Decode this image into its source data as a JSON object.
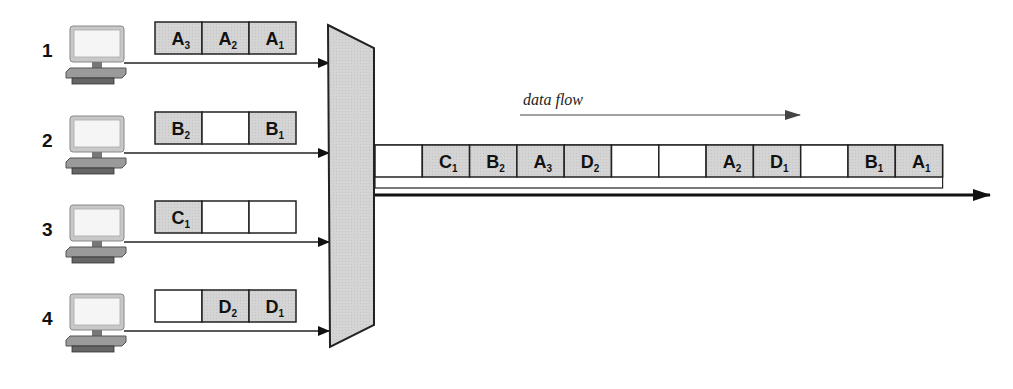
{
  "diagram": {
    "flow_label": "data flow",
    "colors": {
      "filled_slot": "#d6d6d6",
      "empty_slot": "#ffffff",
      "mux": "#cfcfcf",
      "line": "#222222",
      "monitor_screen": "#f4f4f4",
      "monitor_frame": "#bdbdbd"
    },
    "sources": [
      {
        "label": "1",
        "icon": "computer-icon",
        "buffer": [
          {
            "letter": "A",
            "sub": "3"
          },
          {
            "letter": "A",
            "sub": "2"
          },
          {
            "letter": "A",
            "sub": "1"
          }
        ]
      },
      {
        "label": "2",
        "icon": "computer-icon",
        "buffer": [
          {
            "letter": "B",
            "sub": "2"
          },
          {
            "letter": "",
            "sub": ""
          },
          {
            "letter": "B",
            "sub": "1"
          }
        ]
      },
      {
        "label": "3",
        "icon": "computer-icon",
        "buffer": [
          {
            "letter": "C",
            "sub": "1"
          },
          {
            "letter": "",
            "sub": ""
          },
          {
            "letter": "",
            "sub": ""
          }
        ]
      },
      {
        "label": "4",
        "icon": "computer-icon",
        "buffer": [
          {
            "letter": "",
            "sub": ""
          },
          {
            "letter": "D",
            "sub": "2"
          },
          {
            "letter": "D",
            "sub": "1"
          }
        ]
      }
    ],
    "multiplexer": {
      "name": "multiplexer"
    },
    "output_stream": [
      {
        "letter": "",
        "sub": ""
      },
      {
        "letter": "C",
        "sub": "1"
      },
      {
        "letter": "B",
        "sub": "2"
      },
      {
        "letter": "A",
        "sub": "3"
      },
      {
        "letter": "D",
        "sub": "2"
      },
      {
        "letter": "",
        "sub": ""
      },
      {
        "letter": "",
        "sub": ""
      },
      {
        "letter": "A",
        "sub": "2"
      },
      {
        "letter": "D",
        "sub": "1"
      },
      {
        "letter": "",
        "sub": ""
      },
      {
        "letter": "B",
        "sub": "1"
      },
      {
        "letter": "A",
        "sub": "1"
      }
    ]
  }
}
